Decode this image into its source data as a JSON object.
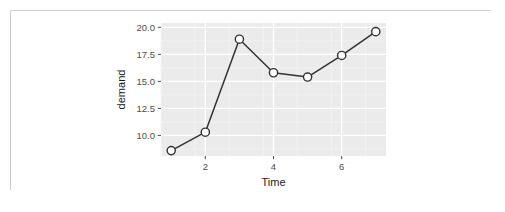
{
  "figure": {
    "background_color": "#ffffff",
    "frame_border_color": "#cfcfcf",
    "panel_color": "#ebebeb",
    "grid_major_color": "#ffffff",
    "grid_minor_color": "#f5f5f5",
    "line_color": "#333333",
    "point_fill_color": "#ffffff",
    "point_stroke_color": "#333333",
    "tick_color": "#4d4d4d",
    "axis_text_color": "#4d4d4d",
    "axis_title_color": "#1a1a1a"
  },
  "chart_data": {
    "type": "line",
    "title": "",
    "subtitle": "",
    "xlabel": "Time",
    "ylabel": "demand",
    "x": [
      1,
      2,
      3,
      4,
      5,
      6,
      7
    ],
    "values": [
      8.6,
      10.3,
      18.9,
      15.8,
      15.4,
      17.4,
      19.6
    ],
    "series": [
      {
        "name": "demand",
        "values": [
          8.6,
          10.3,
          18.9,
          15.8,
          15.4,
          17.4,
          19.6
        ]
      }
    ],
    "xlim": [
      0.7,
      7.3
    ],
    "ylim": [
      8.1,
      20.4
    ],
    "xticks": [
      2,
      4,
      6
    ],
    "xticklabels": [
      "2",
      "4",
      "6"
    ],
    "yticks": [
      10.0,
      12.5,
      15.0,
      17.5,
      20.0
    ],
    "yticklabels": [
      "10.0",
      "12.5",
      "15.0",
      "17.5",
      "20.0"
    ],
    "grid": true,
    "legend": false,
    "legend_position": "none",
    "markers": "open-circle",
    "annotations": []
  },
  "axes": {
    "y": {
      "title": "demand",
      "ticks": [
        {
          "value": 20.0,
          "label": "20.0"
        },
        {
          "value": 17.5,
          "label": "17.5"
        },
        {
          "value": 15.0,
          "label": "15.0"
        },
        {
          "value": 12.5,
          "label": "12.5"
        },
        {
          "value": 10.0,
          "label": "10.0"
        }
      ]
    },
    "x": {
      "title": "Time",
      "ticks": [
        {
          "value": 2,
          "label": "2"
        },
        {
          "value": 4,
          "label": "4"
        },
        {
          "value": 6,
          "label": "6"
        }
      ]
    }
  }
}
